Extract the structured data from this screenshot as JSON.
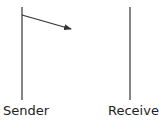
{
  "diagram": {
    "type": "sequence",
    "participants": [
      {
        "name": "Sender",
        "x": 22
      },
      {
        "name": "Receiver",
        "x": 130
      }
    ],
    "messages": [
      {
        "from": "Sender",
        "to": "Receiver",
        "complete": false,
        "label": ""
      }
    ],
    "colors": {
      "line": "#333333",
      "text": "#222222",
      "background": "#ffffff"
    }
  }
}
